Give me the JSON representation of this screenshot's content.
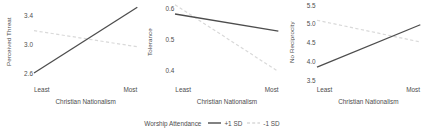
{
  "chart_data": {
    "type": "line",
    "title": "",
    "layout": "three panels side by side, shared x axis",
    "xlabel": "Christian Nationalism",
    "x_tick_labels": [
      "Least",
      "Most"
    ],
    "x": [
      0,
      1
    ],
    "grid": false,
    "legend": {
      "title": "Worship Attendance",
      "position": "bottom-center",
      "entries": [
        {
          "name": "+1 SD",
          "style": "solid",
          "color": "#4d4d4d"
        },
        {
          "name": "-1 SD",
          "style": "dashed",
          "color": "#d9d9d9"
        }
      ]
    },
    "panels": [
      {
        "ylabel": "Perceived Threat",
        "y_tick_labels": [
          "2.6",
          "3.0",
          "3.4"
        ],
        "y_ticks": [
          2.6,
          3.0,
          3.4
        ],
        "ylim": [
          2.45,
          3.6
        ],
        "series": [
          {
            "name": "+1 SD",
            "style": "solid",
            "values": [
              2.6,
              3.5
            ]
          },
          {
            "name": "-1 SD",
            "style": "dashed",
            "values": [
              3.18,
              2.96
            ]
          }
        ]
      },
      {
        "ylabel": "Tolerance",
        "y_tick_labels": [
          "0.4",
          "0.5",
          "0.6"
        ],
        "y_ticks": [
          0.4,
          0.5,
          0.6
        ],
        "ylim": [
          0.355,
          0.625
        ],
        "series": [
          {
            "name": "+1 SD",
            "style": "solid",
            "values": [
              0.58,
              0.525
            ]
          },
          {
            "name": "-1 SD",
            "style": "dashed",
            "values": [
              0.61,
              0.395
            ]
          }
        ]
      },
      {
        "ylabel": "No Reciprocity",
        "y_tick_labels": [
          "3.5",
          "4.0",
          "4.5",
          "5.0",
          "5.5"
        ],
        "y_ticks": [
          3.5,
          4.0,
          4.5,
          5.0,
          5.5
        ],
        "ylim": [
          3.38,
          5.62
        ],
        "series": [
          {
            "name": "+1 SD",
            "style": "solid",
            "values": [
              3.83,
              4.96
            ]
          },
          {
            "name": "-1 SD",
            "style": "dashed",
            "values": [
              5.08,
              4.5
            ]
          }
        ]
      }
    ]
  }
}
